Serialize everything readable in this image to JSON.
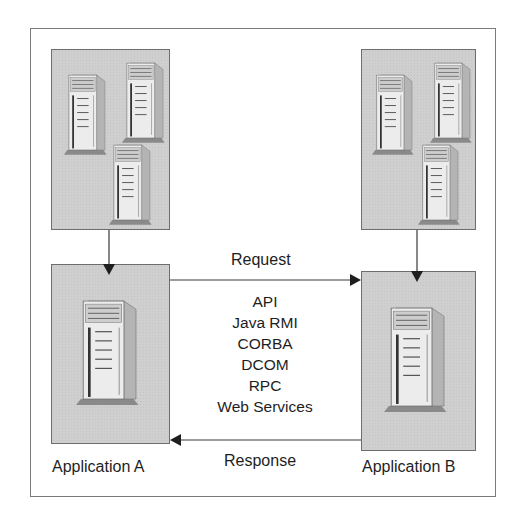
{
  "diagram": {
    "nodes": [
      {
        "id": "cluster-a",
        "label": "",
        "icon": "server-cluster-icon",
        "servers": 3
      },
      {
        "id": "app-a",
        "label": "Application A",
        "icon": "server-icon",
        "servers": 1
      },
      {
        "id": "cluster-b",
        "label": "",
        "icon": "server-cluster-icon",
        "servers": 3
      },
      {
        "id": "app-b",
        "label": "Application B",
        "icon": "server-icon",
        "servers": 1
      }
    ],
    "edges": [
      {
        "from": "cluster-a",
        "to": "app-a",
        "label": ""
      },
      {
        "from": "cluster-b",
        "to": "app-b",
        "label": ""
      },
      {
        "from": "app-a",
        "to": "app-b",
        "label": "Request"
      },
      {
        "from": "app-b",
        "to": "app-a",
        "label": "Response"
      }
    ],
    "request_label": "Request",
    "response_label": "Response",
    "protocols": [
      "API",
      "Java RMI",
      "CORBA",
      "DCOM",
      "RPC",
      "Web Services"
    ],
    "app_a_label": "Application A",
    "app_b_label": "Application B",
    "colors": {
      "box_fill": "#cfcfcf",
      "box_border": "#6d6d6d",
      "line": "#3a3a3a",
      "frame": "#7a7a7a"
    }
  }
}
